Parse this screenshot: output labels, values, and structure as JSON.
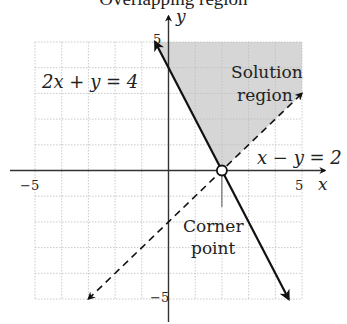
{
  "title": "Overlapping region",
  "chart_data": {
    "type": "line",
    "title": "Overlapping region",
    "xlabel": "x",
    "ylabel": "y",
    "xlim": [
      -5,
      5
    ],
    "ylim": [
      -5,
      5
    ],
    "grid": true,
    "x_ticks": [
      {
        "value": -5,
        "label": "−5"
      },
      {
        "value": 5,
        "label": "5"
      }
    ],
    "y_ticks": [
      {
        "value": 5,
        "label": "5"
      },
      {
        "value": -5,
        "label": "−5"
      }
    ],
    "series": [
      {
        "name": "2x + y = 4",
        "style": "solid",
        "points": [
          [
            -0.5,
            5
          ],
          [
            4.5,
            -5
          ]
        ],
        "arrows": "both"
      },
      {
        "name": "x − y = 2",
        "style": "dashed",
        "points": [
          [
            -3,
            -5
          ],
          [
            5,
            3
          ]
        ],
        "arrows": "both"
      }
    ],
    "shaded_region": {
      "label_lines": [
        "Solution",
        "region"
      ],
      "polygon": [
        [
          -0.5,
          5
        ],
        [
          5,
          5
        ],
        [
          5,
          3
        ],
        [
          2,
          0
        ]
      ],
      "color": "#d6d6d6"
    },
    "corner_point": {
      "x": 2,
      "y": 0,
      "label_lines": [
        "Corner",
        "point"
      ]
    },
    "annotations": [
      {
        "text": "2x + y = 4",
        "at": [
          -3.6,
          3.3
        ]
      },
      {
        "text": "x − y = 2",
        "at": [
          4.1,
          0.9
        ]
      }
    ]
  }
}
